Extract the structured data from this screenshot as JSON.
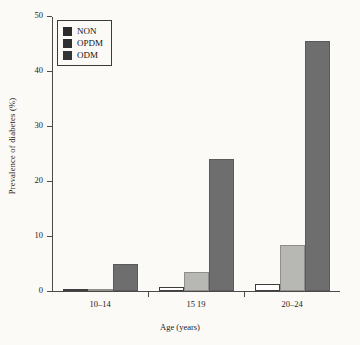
{
  "chart_data": {
    "type": "bar",
    "title": "",
    "xlabel": "Age (years)",
    "ylabel": "Prevalence of diabetes (%)",
    "categories": [
      "10–14",
      "15 19",
      "20–24"
    ],
    "series": [
      {
        "name": "NON",
        "values": [
          0.2,
          0.8,
          1.3
        ],
        "color": "#ffffff"
      },
      {
        "name": "OPDM",
        "values": [
          0.3,
          3.4,
          8.4
        ],
        "color": "#b7b7b4"
      },
      {
        "name": "ODM",
        "values": [
          5.0,
          24.0,
          45.4
        ],
        "color": "#6e6e6e"
      }
    ],
    "ylim": [
      0,
      50
    ],
    "yticks": [
      "0",
      "10",
      "20",
      "30",
      "40",
      "50"
    ],
    "grid": false,
    "legend_position": "top-left"
  }
}
